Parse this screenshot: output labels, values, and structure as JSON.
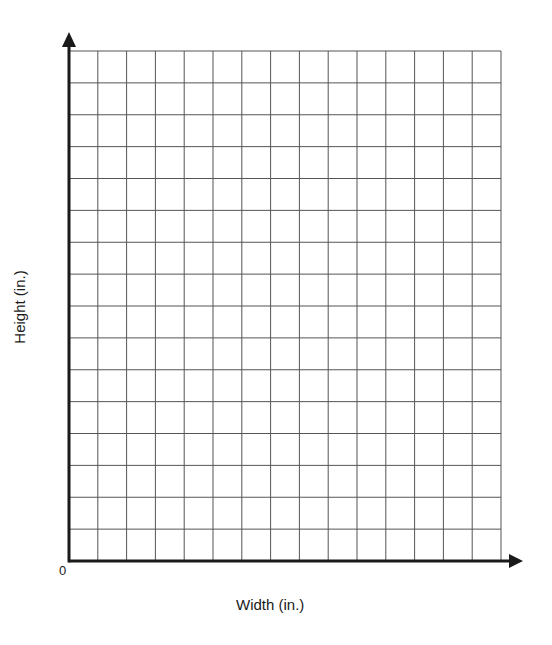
{
  "chart_data": {
    "type": "line",
    "title": "",
    "xlabel": "Width (in.)",
    "ylabel": "Height (in.)",
    "origin_label": "0",
    "series": [],
    "grid": true,
    "grid_columns": 15,
    "grid_rows": 16,
    "x_tick_labels": [],
    "y_tick_labels": [],
    "legend": null
  },
  "colors": {
    "grid": "#555555",
    "axis": "#1a1a1a",
    "background": "#ffffff"
  }
}
